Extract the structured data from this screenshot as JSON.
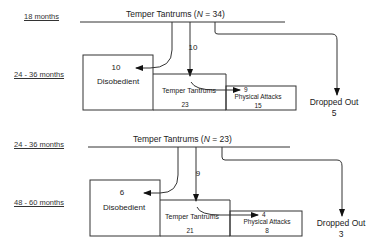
{
  "panels": [
    {
      "from_age": "18 months",
      "to_age": "24 - 36 months",
      "title_prefix": "Temper Tantrums (",
      "title_n": "N",
      "title_suffix": " = 34)",
      "to_disobedient_count": "10",
      "disobedient_label": "Disobedient",
      "to_tantrums_count": "10",
      "tantrums_label": "Temper Tantrums",
      "tantrums_total": "23",
      "to_physical_count": "9",
      "physical_label": "Physical Attacks",
      "physical_total": "15",
      "dropped_label": "Dropped Out",
      "dropped_count": "5"
    },
    {
      "from_age": "24 - 36 months",
      "to_age": "48 - 60 months",
      "title_prefix": "Temper Tantrums (",
      "title_n": "N",
      "title_suffix": " = 23)",
      "to_disobedient_count": "6",
      "disobedient_label": "Disobedient",
      "to_tantrums_count": "9",
      "tantrums_label": "Temper Tantrums",
      "tantrums_total": "21",
      "to_physical_count": "4",
      "physical_label": "Physical Attacks",
      "physical_total": "8",
      "dropped_label": "Dropped Out",
      "dropped_count": "3"
    }
  ]
}
